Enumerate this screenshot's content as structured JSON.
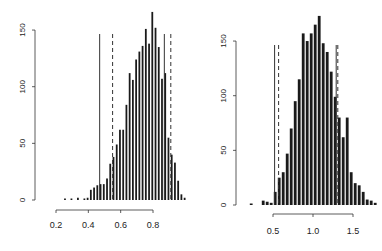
{
  "chart_data": [
    {
      "type": "bar",
      "title": "",
      "xlabel": "",
      "ylabel": "",
      "xlim": [
        0.2,
        0.95
      ],
      "ylim": [
        0,
        160
      ],
      "x_ticks": [
        "0.2",
        "0.4",
        "0.6",
        "0.8"
      ],
      "y_ticks": [
        "0",
        "50",
        "100",
        "150"
      ],
      "grid": false,
      "bin_start": 0.25,
      "bin_width": 0.02,
      "values": [
        1,
        0,
        1,
        0,
        2,
        0,
        1,
        2,
        9,
        11,
        13,
        14,
        14,
        19,
        32,
        38,
        49,
        62,
        62,
        84,
        112,
        106,
        124,
        131,
        136,
        151,
        138,
        166,
        152,
        135,
        107,
        112,
        55,
        40,
        33,
        17,
        5,
        2
      ],
      "vlines": [
        {
          "x": 0.47,
          "style": "solid"
        },
        {
          "x": 0.55,
          "style": "dashed"
        },
        {
          "x": 0.87,
          "style": "solid"
        },
        {
          "x": 0.91,
          "style": "dashed"
        }
      ]
    },
    {
      "type": "bar",
      "title": "",
      "xlabel": "",
      "ylabel": "",
      "xlim": [
        0.2,
        1.65
      ],
      "ylim": [
        0,
        160
      ],
      "x_ticks": [
        "0.5",
        "1.0",
        "1.5"
      ],
      "y_ticks": [
        "0",
        "50",
        "100",
        "150"
      ],
      "grid": false,
      "bin_start": 0.21,
      "bin_width": 0.05,
      "values": [
        1,
        0,
        0,
        4,
        3,
        2,
        12,
        25,
        30,
        47,
        70,
        95,
        115,
        157,
        150,
        157,
        165,
        173,
        148,
        140,
        122,
        99,
        80,
        62,
        80,
        30,
        20,
        18,
        12,
        5,
        4,
        2
      ],
      "vlines": [
        {
          "x": 0.52,
          "style": "solid"
        },
        {
          "x": 0.57,
          "style": "dashed"
        },
        {
          "x": 1.29,
          "style": "solid"
        },
        {
          "x": 1.31,
          "style": "dashed"
        }
      ]
    }
  ]
}
